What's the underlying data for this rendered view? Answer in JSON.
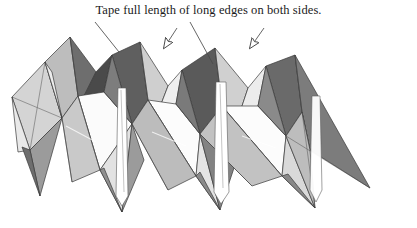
{
  "document": {
    "title": "Tape full length of long edges on both sides.",
    "caption": "Tape full length of long edges on both sides."
  },
  "figure": {
    "background_color": "#ffffff",
    "ink_color": "#1a1a1a",
    "shading": {
      "white": "#ffffff",
      "very_light_gray": "#e9e9e9",
      "light_gray": "#d4d4d4",
      "mid_light_gray": "#bdbdbd",
      "mid_gray": "#9b9b9b",
      "dark_gray": "#6e6e6e",
      "very_dark_gray": "#4a4a4a",
      "near_black": "#2b2b2b"
    },
    "outline_color": "#3a3a3a",
    "bounds": {
      "x": 10,
      "y": 33,
      "width": 360,
      "height": 180
    },
    "peaks": [
      70,
      140,
      215,
      295
    ],
    "valleys": [
      120,
      220,
      315
    ],
    "tape_strips": [
      {
        "label": "tape-strip-left",
        "x": 122
      },
      {
        "label": "tape-strip-center",
        "x": 222
      },
      {
        "label": "tape-strip-right",
        "x": 318
      }
    ],
    "leader_lines": [
      {
        "label": "leader-line-left",
        "x1": 95,
        "y1": 22,
        "x2": 119,
        "y2": 52
      },
      {
        "label": "leader-line-right",
        "x1": 190,
        "y1": 22,
        "x2": 213,
        "y2": 64
      }
    ],
    "arrows": [
      {
        "label": "arrow-left",
        "x1": 176,
        "y1": 29,
        "x2": 161,
        "y2": 52,
        "style": "hollow-head"
      },
      {
        "label": "arrow-right",
        "x1": 263,
        "y1": 29,
        "x2": 247,
        "y2": 52,
        "style": "hollow-head"
      }
    ]
  }
}
